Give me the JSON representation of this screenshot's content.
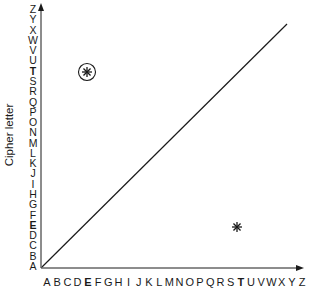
{
  "diagram": {
    "y_axis_label": "Cipher letter",
    "x_axis_letters": [
      "A",
      "B",
      "C",
      "D",
      "E",
      "F",
      "G",
      "H",
      "I",
      "J",
      "K",
      "L",
      "M",
      "N",
      "O",
      "P",
      "Q",
      "R",
      "S",
      "T",
      "U",
      "V",
      "W",
      "X",
      "Y",
      "Z"
    ],
    "y_axis_letters": [
      "A",
      "B",
      "C",
      "D",
      "E",
      "F",
      "G",
      "H",
      "I",
      "J",
      "K",
      "L",
      "M",
      "N",
      "O",
      "P",
      "Q",
      "R",
      "S",
      "T",
      "U",
      "V",
      "W",
      "X",
      "Y",
      "Z"
    ],
    "bold_x_letters": [
      "E",
      "T"
    ],
    "bold_y_letters": [
      "E",
      "T"
    ],
    "diagonal_line": {
      "from": [
        0,
        0
      ],
      "to": [
        1,
        1
      ],
      "label": "identity mapping"
    },
    "markers": [
      {
        "name": "circled-star",
        "x_letter": "E",
        "y_letter": "T",
        "circled": true
      },
      {
        "name": "star",
        "x_letter": "T",
        "y_letter": "E",
        "circled": false
      }
    ],
    "colors": {
      "ink": "#1a1a1a",
      "background": "#ffffff"
    }
  }
}
